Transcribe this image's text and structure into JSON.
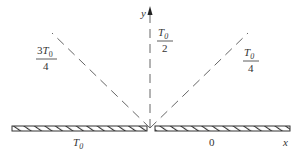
{
  "figure": {
    "axes": {
      "x_label": "x",
      "y_label": "y"
    },
    "regions": [
      {
        "id": "left-plate",
        "label": "T",
        "subscript": "0",
        "description": "boundary x<0 held at temperature T0"
      },
      {
        "id": "right-plate",
        "label": "0",
        "description": "boundary x>0 held at temperature 0"
      }
    ],
    "isotherms": [
      {
        "id": "isotherm-3T0-4",
        "numerator_prefix": "3",
        "numerator": "T",
        "subscript": "0",
        "denominator": "4",
        "angle_deg": 135
      },
      {
        "id": "isotherm-T0-2",
        "numerator_prefix": "",
        "numerator": "T",
        "subscript": "0",
        "denominator": "2",
        "angle_deg": 90
      },
      {
        "id": "isotherm-T0-4",
        "numerator_prefix": "",
        "numerator": "T",
        "subscript": "0",
        "denominator": "4",
        "angle_deg": 45
      }
    ],
    "colors": {
      "ink": "#333333",
      "dash": "#666666"
    }
  }
}
